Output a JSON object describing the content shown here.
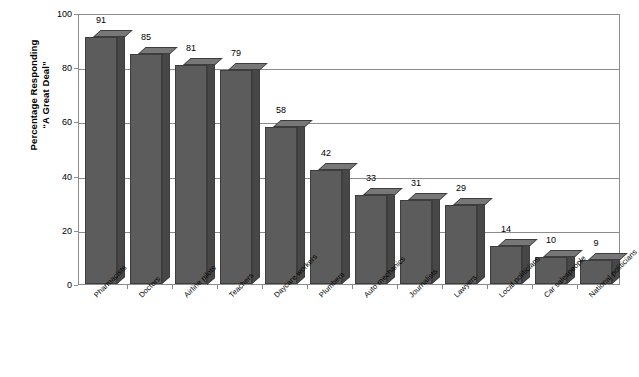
{
  "chart_data": {
    "type": "bar",
    "title": "",
    "subtitle": "",
    "xlabel": "",
    "ylabel": "Percentage Responding \"A Great Deal\"",
    "ylabel_lines": [
      "Percentage Responding",
      "“A Great Deal”"
    ],
    "ylim": [
      0,
      100
    ],
    "yticks": [
      0,
      20,
      40,
      60,
      80,
      100
    ],
    "ytick_labels": [
      "0",
      "20",
      "40",
      "60",
      "80",
      "100"
    ],
    "grid": true,
    "grid_axis": "y",
    "legend": false,
    "legend_position": "none",
    "bar_style": "3d-column",
    "categories": [
      "Pharmacists",
      "Doctors",
      "Airline pilots",
      "Teachers",
      "Daycare workers",
      "Plumbers",
      "Auto mechanics",
      "Journalists",
      "Lawyers",
      "Local politicians",
      "Car salespeople",
      "National politicians"
    ],
    "values": [
      91,
      85,
      81,
      79,
      58,
      42,
      33,
      31,
      29,
      14,
      10,
      9
    ],
    "data_labels": [
      "91",
      "85",
      "81",
      "79",
      "58",
      "42",
      "33",
      "31",
      "29",
      "14",
      "10",
      "9"
    ]
  },
  "colors": {
    "bar_front": "#5c5c5c",
    "bar_top": "#777777",
    "bar_side": "#474747",
    "bar_outline": "#3d3d3d",
    "gridline": "#8c8c8c",
    "frame": "#8c8c8c",
    "plot_background": "#ffffff",
    "page_background": "#ffffff",
    "text": "#000000"
  }
}
